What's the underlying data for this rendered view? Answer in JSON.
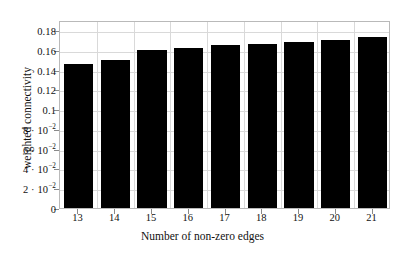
{
  "chart_data": {
    "type": "bar",
    "title": "",
    "xlabel": "Number of non-zero edges",
    "ylabel": "weighted connectivity",
    "categories": [
      "13",
      "14",
      "15",
      "16",
      "17",
      "18",
      "19",
      "20",
      "21"
    ],
    "values": [
      0.146,
      0.15,
      0.16,
      0.162,
      0.165,
      0.166,
      0.168,
      0.17,
      0.173
    ],
    "series": [
      {
        "name": "weighted connectivity",
        "values": [
          0.146,
          0.15,
          0.16,
          0.162,
          0.165,
          0.166,
          0.168,
          0.17,
          0.173
        ]
      }
    ],
    "ylim": [
      0,
      0.19
    ],
    "xlim": [
      12.5,
      21.5
    ],
    "y_ticks": [
      0,
      0.02,
      0.04,
      0.06,
      0.08,
      0.1,
      0.12,
      0.14,
      0.16,
      0.18
    ],
    "y_tick_labels": [
      {
        "value": 0.18,
        "text": "0.18",
        "coef": "",
        "mantissa": "0.18",
        "exp": ""
      },
      {
        "value": 0.16,
        "text": "0.16",
        "coef": "",
        "mantissa": "0.16",
        "exp": ""
      },
      {
        "value": 0.14,
        "text": "0.14",
        "coef": "",
        "mantissa": "0.14",
        "exp": ""
      },
      {
        "value": 0.12,
        "text": "0.12",
        "coef": "",
        "mantissa": "0.12",
        "exp": ""
      },
      {
        "value": 0.1,
        "text": "0.1",
        "coef": "",
        "mantissa": "0.1",
        "exp": ""
      },
      {
        "value": 0.08,
        "text": "8 · 10⁻²",
        "coef": "8 · ",
        "mantissa": "10",
        "exp": "−2"
      },
      {
        "value": 0.06,
        "text": "6 · 10⁻²",
        "coef": "6 · ",
        "mantissa": "10",
        "exp": "−2"
      },
      {
        "value": 0.04,
        "text": "4 · 10⁻²",
        "coef": "4 · ",
        "mantissa": "10",
        "exp": "−2"
      },
      {
        "value": 0.02,
        "text": "2 · 10⁻²",
        "coef": "2 · ",
        "mantissa": "10",
        "exp": "−2"
      },
      {
        "value": 0.0,
        "text": "0",
        "coef": "",
        "mantissa": "0",
        "exp": ""
      }
    ],
    "x_tick_labels": [
      "13",
      "14",
      "15",
      "16",
      "17",
      "18",
      "19",
      "20",
      "21"
    ],
    "grid": true,
    "grid_color": "#d9d9d9",
    "bar_color": "#000000",
    "frame_color": "#b9b9b9",
    "legend": null,
    "legend_position": "none",
    "annotations": []
  }
}
